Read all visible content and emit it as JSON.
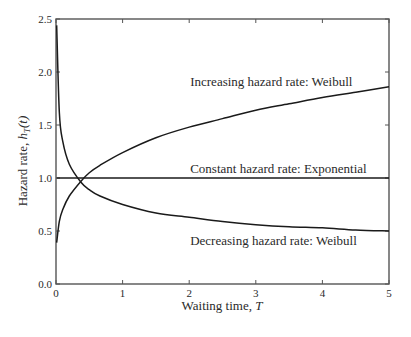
{
  "chart_data": {
    "type": "line",
    "title": "",
    "xlabel": "Waiting time, T",
    "ylabel": "Hazard rate, h_T(t)",
    "xlim": [
      0,
      5
    ],
    "ylim": [
      0.0,
      2.5
    ],
    "xticks": [
      0,
      1,
      2,
      3,
      4,
      5
    ],
    "xtick_labels": [
      "0",
      "1",
      "2",
      "3",
      "4",
      "5"
    ],
    "yticks": [
      0.0,
      0.5,
      1.0,
      1.5,
      2.0,
      2.5
    ],
    "ytick_labels": [
      "0.0",
      "0.5",
      "1.0",
      "1.5",
      "2.0",
      "2.5"
    ],
    "grid": false,
    "legend": "none (inline annotations)",
    "x": [
      0.01,
      0.05,
      0.1,
      0.2,
      0.375,
      0.5,
      0.66,
      1,
      1.5,
      2,
      2.5,
      3,
      3.5,
      4,
      4.5,
      5
    ],
    "series": [
      {
        "name": "Increasing hazard rate: Weibull",
        "values": [
          0.39,
          0.59,
          0.7,
          0.83,
          0.97,
          1.05,
          1.12,
          1.24,
          1.38,
          1.48,
          1.56,
          1.64,
          1.7,
          1.76,
          1.81,
          1.86
        ]
      },
      {
        "name": "Constant hazard rate: Exponential",
        "values": [
          1.0,
          1.0,
          1.0,
          1.0,
          1.0,
          1.0,
          1.0,
          1.0,
          1.0,
          1.0,
          1.0,
          1.0,
          1.0,
          1.0,
          1.0,
          1.0
        ]
      },
      {
        "name": "Decreasing hazard rate: Weibull",
        "values": [
          2.44,
          1.62,
          1.35,
          1.13,
          0.96,
          0.89,
          0.83,
          0.75,
          0.67,
          0.63,
          0.59,
          0.56,
          0.54,
          0.53,
          0.51,
          0.5
        ]
      }
    ],
    "annotations": [
      {
        "text": "Increasing hazard rate: Weibull",
        "x": 2.0,
        "y": 1.87
      },
      {
        "text": "Constant hazard rate: Exponential",
        "x": 2.0,
        "y": 1.05
      },
      {
        "text": "Decreasing hazard rate: Weibull",
        "x": 2.0,
        "y": 0.37
      }
    ]
  },
  "labels": {
    "xlabel_main": "Waiting time, ",
    "xlabel_var": "T",
    "ylabel_main": "Hazard rate, ",
    "ylabel_var": "h",
    "ylabel_sub": "T",
    "ylabel_arg": "(t)"
  },
  "colors": {
    "line": "#1a1a1a",
    "axis": "#555555",
    "text": "#2a2a2a"
  }
}
